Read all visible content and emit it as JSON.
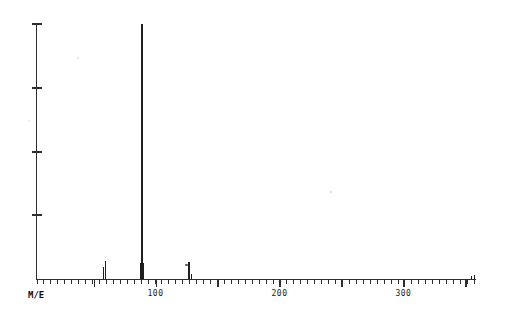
{
  "chart_data": {
    "type": "bar",
    "chart_kind": "mass-spectrum",
    "title": "",
    "xlabel": "M/E",
    "ylabel": "",
    "x_axis": {
      "min": 4,
      "max": 358,
      "labeled_ticks": [
        100,
        200,
        300
      ],
      "major_ticks": [
        50,
        100,
        150,
        200,
        250,
        300,
        350
      ],
      "minor_tick_spacing_mz": 5.6,
      "grid": false
    },
    "y_axis": {
      "min": 0,
      "max": 100,
      "tick_values": [
        25,
        50,
        75,
        100
      ],
      "labels_shown": false,
      "unit": "relative intensity %"
    },
    "legend": null,
    "peaks": [
      {
        "mz": 58,
        "rel_intensity": 4.7
      },
      {
        "mz": 60,
        "rel_intensity": 7.1
      },
      {
        "mz": 88,
        "rel_intensity": 6.3
      },
      {
        "mz": 89,
        "rel_intensity": 100.0,
        "is_base_peak": true
      },
      {
        "mz": 90,
        "rel_intensity": 6.3
      },
      {
        "mz": 127,
        "rel_intensity": 6.8
      },
      {
        "mz": 129,
        "rel_intensity": 2.0
      },
      {
        "mz": 355,
        "rel_intensity": 1.2
      },
      {
        "mz": 357,
        "rel_intensity": 1.6
      }
    ],
    "colors": {
      "background": "#ffffff",
      "axis": "#2e2e2e",
      "peak": "#1f1f1f",
      "label": "#1c1c1c"
    }
  },
  "artifacts": {
    "specks": [
      {
        "x": 185,
        "y": 264,
        "w": 3,
        "h": 1.5,
        "color": "#5a5a5a"
      },
      {
        "x": 330,
        "y": 191,
        "w": 2,
        "h": 2,
        "color": "#dddddd"
      },
      {
        "x": 77,
        "y": 57,
        "w": 2,
        "h": 2,
        "color": "#e3e3e3"
      },
      {
        "x": 28,
        "y": 120,
        "w": 2,
        "h": 2,
        "color": "#e6e6e6"
      }
    ]
  }
}
